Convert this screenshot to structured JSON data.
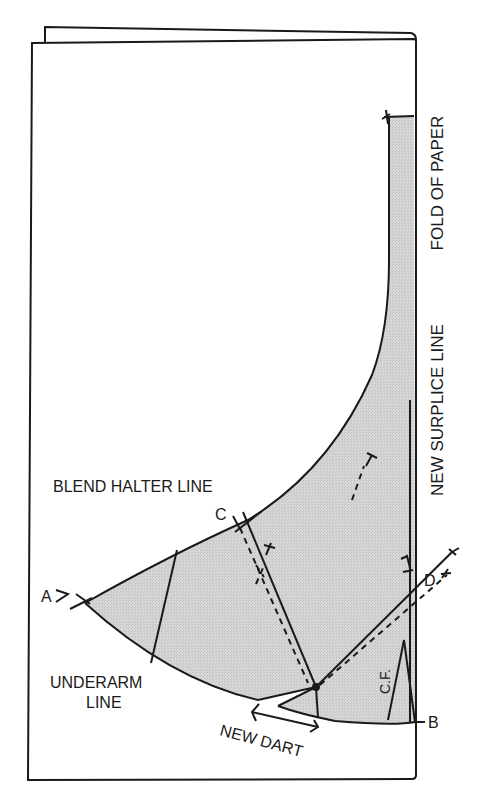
{
  "figure": {
    "type": "pattern-drafting-diagram",
    "paper": {
      "state": "folded",
      "fill": "#ffffff",
      "stroke": "#1a1a1a"
    },
    "shaded_piece": {
      "fill": "#d4d4d4",
      "stroke": "#1a1a1a"
    }
  },
  "labels": {
    "fold_of_paper": "FOLD OF PAPER",
    "new_surplice_line": "NEW SURPLICE LINE",
    "blend_halter_line": "BLEND HALTER LINE",
    "point_a": "A",
    "point_b": "B",
    "point_c": "C",
    "point_d": "D",
    "underarm_line_1": "UNDERARM",
    "underarm_line_2": "LINE",
    "new_dart": "NEW DART",
    "center_front": "C.F."
  }
}
